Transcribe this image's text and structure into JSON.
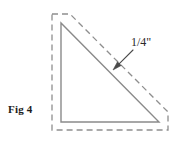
{
  "figure": {
    "caption": "Fig 4",
    "dimension_label": "1/4\"",
    "colors": {
      "background": "#ffffff",
      "solid_line": "#8a8a8a",
      "dashed_line": "#8e8e8e",
      "leader_line": "#4a4a4a",
      "text": "#1c1c1c"
    },
    "shapes": {
      "solid_triangle": {
        "name": "finished-right-triangle",
        "points": "61,23 61,122 159,122",
        "stroke_width": 1.4
      },
      "dashed_outline": {
        "name": "seam-allowance-outline",
        "points": "52,14 70,14 168,112 168,130 52,130",
        "stroke_width": 1.3,
        "dash_pattern": "6 4"
      },
      "leader": {
        "name": "dimension-leader-line",
        "x1": 133,
        "y1": 50,
        "x2": 115,
        "y2": 68,
        "arrow_tip_x": 113,
        "arrow_tip_y": 70
      }
    }
  }
}
